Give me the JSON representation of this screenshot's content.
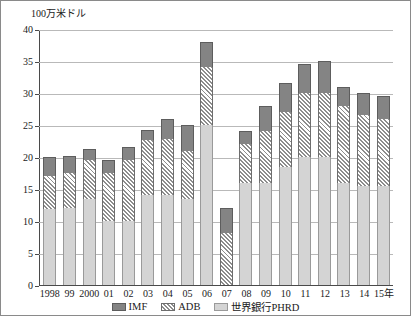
{
  "chart_data": {
    "type": "bar",
    "stacked": true,
    "title": "",
    "subtitle": "",
    "ylabel": "100万米ドル",
    "xlabel": "",
    "xlabel_suffix": "年",
    "ylim": [
      0,
      40
    ],
    "ytick_step": 5,
    "ytick_labels": [
      "0",
      "5",
      "10",
      "15",
      "20",
      "25",
      "30",
      "35",
      "40"
    ],
    "grid": true,
    "legend_position": "bottom",
    "categories": [
      "1998",
      "99",
      "2000",
      "01",
      "02",
      "03",
      "04",
      "05",
      "06",
      "07",
      "08",
      "09",
      "10",
      "11",
      "12",
      "13",
      "14",
      "15年"
    ],
    "series": [
      {
        "name": "世界銀行PHRD",
        "color": "#d4d4d4",
        "pattern": "solid-light",
        "values": [
          11.8,
          12.0,
          13.5,
          10.0,
          10.0,
          14.0,
          14.0,
          13.5,
          25.0,
          0.0,
          16.0,
          16.0,
          18.5,
          20.0,
          20.0,
          16.0,
          15.5,
          15.5
        ]
      },
      {
        "name": "ADB",
        "color": "#8d8d8d",
        "pattern": "diagonal-hatch",
        "values": [
          5.2,
          5.5,
          6.0,
          7.5,
          9.5,
          8.7,
          8.8,
          7.5,
          9.0,
          8.2,
          6.0,
          8.0,
          8.5,
          10.0,
          10.0,
          12.0,
          11.0,
          10.5
        ]
      },
      {
        "name": "IMF",
        "color": "#848484",
        "pattern": "solid-dark",
        "values": [
          3.0,
          2.7,
          1.8,
          2.0,
          2.0,
          1.6,
          3.2,
          4.0,
          4.0,
          3.8,
          2.0,
          4.0,
          4.5,
          4.5,
          5.0,
          3.0,
          3.5,
          3.5
        ]
      }
    ],
    "totals": [
      20.0,
      20.2,
      21.3,
      19.5,
      21.5,
      24.3,
      26.0,
      25.0,
      38.0,
      12.0,
      24.0,
      28.0,
      31.5,
      34.5,
      35.0,
      31.0,
      30.0,
      29.5
    ]
  },
  "legend": {
    "items": [
      {
        "label": "IMF",
        "swatch": "imf-swatch-icon"
      },
      {
        "label": "ADB",
        "swatch": "adb-swatch-icon"
      },
      {
        "label": "世界銀行PHRD",
        "swatch": "phrd-swatch-icon"
      }
    ]
  }
}
